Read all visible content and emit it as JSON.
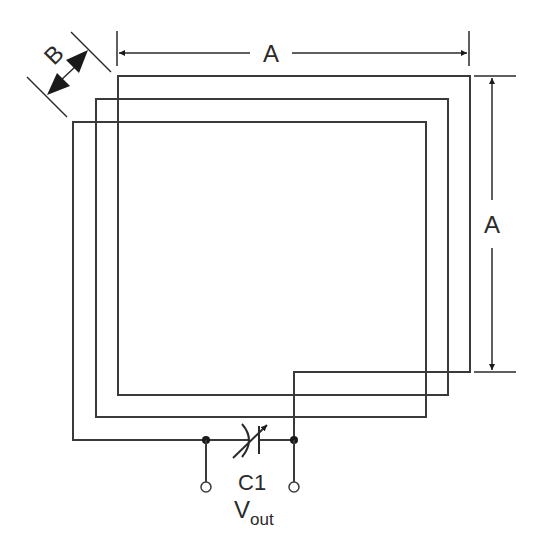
{
  "diagram": {
    "labels": {
      "side_top": "A",
      "side_right": "A",
      "spacing": "B",
      "capacitor": "C1",
      "output_main": "V",
      "output_sub": "out"
    },
    "components": [
      {
        "id": "loop",
        "type": "spiral-coil",
        "turns": 3
      },
      {
        "id": "C1",
        "type": "variable-capacitor"
      },
      {
        "id": "vout",
        "type": "output-terminals",
        "count": 2
      }
    ],
    "colors": {
      "line": "#3a3a3a",
      "fill": "#1a1a1a",
      "background": "#ffffff"
    }
  }
}
